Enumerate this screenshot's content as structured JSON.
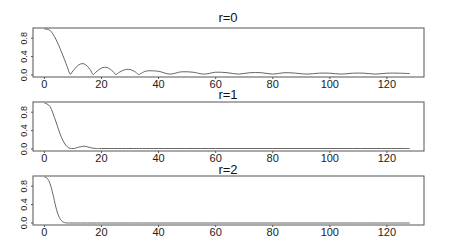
{
  "chart_data": [
    {
      "type": "line",
      "title": "r=0",
      "xlabel": "",
      "ylabel": "",
      "xlim": [
        -4,
        133
      ],
      "ylim": [
        0,
        1.0
      ],
      "xticks": [
        0,
        20,
        40,
        60,
        80,
        100,
        120
      ],
      "yticks": [
        "0.0",
        "0.4",
        "0.8"
      ],
      "grid": false,
      "description": "Sinc-like magnitude: plateau near 1, drops to 0 near x=9, decaying ripples of period ~8",
      "x": [
        0,
        2,
        4,
        6,
        8,
        9,
        10,
        12,
        14,
        16,
        17,
        18,
        20,
        22,
        24,
        25,
        26,
        28,
        30,
        32,
        33,
        34,
        36,
        40,
        44,
        48,
        52,
        56,
        60,
        64,
        68,
        72,
        76,
        80,
        84,
        88,
        92,
        96,
        100,
        104,
        108,
        112,
        116,
        120,
        124,
        128
      ],
      "values": [
        1.0,
        0.97,
        0.78,
        0.5,
        0.18,
        0.02,
        0.09,
        0.22,
        0.24,
        0.12,
        0.01,
        0.06,
        0.15,
        0.16,
        0.08,
        0.01,
        0.05,
        0.11,
        0.12,
        0.06,
        0.01,
        0.04,
        0.09,
        0.08,
        0.02,
        0.07,
        0.06,
        0.02,
        0.06,
        0.05,
        0.02,
        0.05,
        0.05,
        0.02,
        0.05,
        0.04,
        0.02,
        0.04,
        0.04,
        0.02,
        0.04,
        0.04,
        0.02,
        0.04,
        0.04,
        0.03
      ]
    },
    {
      "type": "line",
      "title": "r=1",
      "xlabel": "",
      "ylabel": "",
      "xlim": [
        -4,
        133
      ],
      "ylim": [
        0,
        1.0
      ],
      "xticks": [
        0,
        20,
        40,
        60,
        80,
        100,
        120
      ],
      "yticks": [
        "0.0",
        "0.4",
        "0.8"
      ],
      "grid": false,
      "description": "Smoother decay: near 1 at x=0, falls to ~0 by x=10, tiny bump near x=14, flat after",
      "x": [
        0,
        2,
        4,
        6,
        8,
        10,
        12,
        14,
        16,
        18,
        20,
        30,
        40,
        60,
        80,
        100,
        120,
        128
      ],
      "values": [
        1.0,
        0.92,
        0.6,
        0.25,
        0.05,
        0.01,
        0.04,
        0.06,
        0.03,
        0.01,
        0.01,
        0.01,
        0.01,
        0.01,
        0.01,
        0.01,
        0.01,
        0.01
      ]
    },
    {
      "type": "line",
      "title": "r=2",
      "xlabel": "",
      "ylabel": "",
      "xlim": [
        -4,
        133
      ],
      "ylim": [
        0,
        1.0
      ],
      "xticks": [
        0,
        20,
        40,
        60,
        80,
        100,
        120
      ],
      "yticks": [
        "0.0",
        "0.4",
        "0.8"
      ],
      "grid": false,
      "description": "Sharp monotone decay from 1 to 0 by x~8, flat thereafter",
      "x": [
        0,
        1,
        2,
        3,
        4,
        5,
        6,
        7,
        8,
        10,
        20,
        40,
        60,
        80,
        100,
        120,
        128
      ],
      "values": [
        1.0,
        0.97,
        0.85,
        0.62,
        0.35,
        0.15,
        0.05,
        0.01,
        0.0,
        0.0,
        0.0,
        0.0,
        0.0,
        0.0,
        0.0,
        0.0,
        0.0
      ]
    }
  ],
  "panels": [
    {
      "title": "r=0"
    },
    {
      "title": "r=1"
    },
    {
      "title": "r=2"
    }
  ]
}
